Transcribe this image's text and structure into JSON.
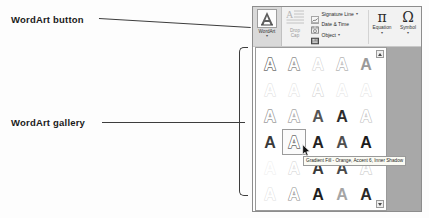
{
  "callouts": {
    "wordart_button_label": "WordArt button",
    "wordart_gallery_label": "WordArt gallery"
  },
  "ribbon": {
    "wordart": {
      "label": "WordArt",
      "caret": "▾",
      "icon": "wordart-a-icon"
    },
    "drop_cap": {
      "label_line1": "Drop",
      "label_line2": "Cap",
      "caret": "▾",
      "icon": "drop-cap-icon"
    },
    "commands": [
      {
        "label": "Signature Line",
        "icon": "signature-line-icon",
        "caret": "▾"
      },
      {
        "label": "Date & Time",
        "icon": "date-time-icon",
        "caret": ""
      },
      {
        "label": "Object",
        "icon": "object-icon",
        "caret": "▾"
      }
    ],
    "equation": {
      "glyph": "π",
      "label": "Equation",
      "caret": "▾"
    },
    "symbol": {
      "glyph": "Ω",
      "label": "Symbol",
      "caret": "▾"
    }
  },
  "gallery": {
    "scroll_up_icon": "scroll-up-arrow-icon",
    "scroll_down_icon": "scroll-down-arrow-icon",
    "selected_index": 16,
    "styles": [
      {
        "letter": "A",
        "name": "Fill - Black, Text 1, Shadow",
        "fill": "#6e6e6e",
        "stroke": "#4a4a4a",
        "outline": true,
        "strokew": 1.4
      },
      {
        "letter": "A",
        "name": "Fill - Blue, Accent 1, Shadow",
        "fill": "#8f8f8f",
        "stroke": "#5c5c5c",
        "outline": true,
        "strokew": 1.4
      },
      {
        "letter": "A",
        "name": "Fill - Orange, Accent 2, Outline - Accent 2",
        "fill": "#cfcfcf",
        "stroke": "#b6b6b6",
        "outline": true,
        "strokew": 1.0
      },
      {
        "letter": "A",
        "name": "Fill - White, Outline - Accent 1, Shadow",
        "fill": "#b5b5b5",
        "stroke": "#787878",
        "outline": true,
        "strokew": 1.3
      },
      {
        "letter": "A",
        "name": "Fill - Gray-50%, Accent 3, Sharp Bevel",
        "fill": "#9a9a9a",
        "stroke": "#6f6f6f",
        "outline": false,
        "strokew": 0
      },
      {
        "letter": "A",
        "name": "Gradient Fill - Gray",
        "fill": "#dcdcdc",
        "stroke": "#c4c4c4",
        "outline": true,
        "strokew": 0.9
      },
      {
        "letter": "A",
        "name": "Gradient Fill - Blue, Accent 1, Reflection",
        "fill": "#e0e0e0",
        "stroke": "#c2c2c2",
        "outline": true,
        "strokew": 0.9
      },
      {
        "letter": "A",
        "name": "Gradient Fill - Orange, Accent 2, Reflection",
        "fill": "#cdcdcd",
        "stroke": "#a9a9a9",
        "outline": true,
        "strokew": 0.9
      },
      {
        "letter": "A",
        "name": "Fill - White, Outline - Accent 2, Hard Shadow",
        "fill": "#e3e3e3",
        "stroke": "#cacaca",
        "outline": true,
        "strokew": 0.9
      },
      {
        "letter": "A",
        "name": "Fill - Gray-25%, Background 2, Inner Shadow",
        "fill": "#e2e2e2",
        "stroke": "#c8c8c8",
        "outline": true,
        "strokew": 0.9
      },
      {
        "letter": "A",
        "name": "Fill - Black, Text 1, Outline - Background 1",
        "fill": "#9d9d9d",
        "stroke": "#5f5f5f",
        "outline": true,
        "strokew": 1.5
      },
      {
        "letter": "A",
        "name": "Fill - Blue, Accent 1, Outline - Background 1",
        "fill": "#a9a9a9",
        "stroke": "#6a6a6a",
        "outline": true,
        "strokew": 1.5
      },
      {
        "letter": "A",
        "name": "Fill - Gray-50%, Accent 3, Hard Shadow",
        "fill": "#555555",
        "stroke": "#3a3a3a",
        "outline": false,
        "strokew": 0
      },
      {
        "letter": "A",
        "name": "Fill - Black, Text 1, Hard Shadow, Accent 1",
        "fill": "#2d2d2d",
        "stroke": "#1f1f1f",
        "outline": false,
        "strokew": 0
      },
      {
        "letter": "A",
        "name": "Fill - Orange, Accent 2, Matte Bevel",
        "fill": "#c0c0c0",
        "stroke": "#9d9d9d",
        "outline": true,
        "strokew": 1.2
      },
      {
        "letter": "A",
        "name": "Fill - Black, Text 1, Shadow",
        "fill": "#3a3a3a",
        "stroke": "#262626",
        "outline": false,
        "strokew": 0
      },
      {
        "letter": "A",
        "name": "Gradient Fill - Orange, Accent 6, Inner Shadow",
        "fill": "#6a6a6a",
        "stroke": "#4d4d4d",
        "outline": true,
        "strokew": 1.3
      },
      {
        "letter": "A",
        "name": "Fill - Gray-50%, Accent 3, Sharp Bevel",
        "fill": "#232323",
        "stroke": "#141414",
        "outline": false,
        "strokew": 0
      },
      {
        "letter": "A",
        "name": "Fill - Blue, Accent 1, Outline - Background 1, Hard Shadow",
        "fill": "#4f4f4f",
        "stroke": "#333333",
        "outline": false,
        "strokew": 0
      },
      {
        "letter": "A",
        "name": "Fill - Black, Text 1, Outline - Background 1, Hard Shadow",
        "fill": "#1b1b1b",
        "stroke": "#0d0d0d",
        "outline": false,
        "strokew": 0
      },
      {
        "letter": "A",
        "name": "Gradient Fill - Gray, Outline - Gray",
        "fill": "#ededed",
        "stroke": "#d8d8d8",
        "outline": true,
        "strokew": 0.9
      },
      {
        "letter": "A",
        "name": "Gradient Fill - Blue, Accent 1, Outline",
        "fill": "#d2d2d2",
        "stroke": "#aeaeae",
        "outline": true,
        "strokew": 0.9
      },
      {
        "letter": "A",
        "name": "Fill - Gray-50%, Accent 3, Powder Bevel",
        "fill": "#3a3a3a",
        "stroke": "#252525",
        "outline": false,
        "strokew": 0
      },
      {
        "letter": "A",
        "name": "Fill - Orange, Accent 2, Outline - Accent 2",
        "fill": "#4a4a4a",
        "stroke": "#303030",
        "outline": false,
        "strokew": 0
      },
      {
        "letter": "A",
        "name": "Fill - White, Outline - Accent 1, Glow - Accent 1",
        "fill": "#d5d5d5",
        "stroke": "#a0a0a0",
        "outline": true,
        "strokew": 1.4
      },
      {
        "letter": "A",
        "name": "Fill - White, Outline - Accent 2, Hard Shadow - Accent 2",
        "fill": "#e0e0e0",
        "stroke": "#c0c0c0",
        "outline": true,
        "strokew": 1.0
      },
      {
        "letter": "A",
        "name": "Gradient Fill - Gray, Outline - Gray, Reflection",
        "fill": "#8f8f8f",
        "stroke": "#636363",
        "outline": true,
        "strokew": 1.2
      },
      {
        "letter": "A",
        "name": "Fill - Black, Text 1, Shadow, Bevel",
        "fill": "#1e1e1e",
        "stroke": "#101010",
        "outline": false,
        "strokew": 0
      },
      {
        "letter": "A",
        "name": "Fill - Gray-50%, Accent 3, Reflection",
        "fill": "#a5a5a5",
        "stroke": "#7a7a7a",
        "outline": false,
        "strokew": 0
      },
      {
        "letter": "A",
        "name": "Fill - Black, Text 1, Inner Shadow",
        "fill": "#2a2a2a",
        "stroke": "#1a1a1a",
        "outline": false,
        "strokew": 0
      }
    ]
  },
  "tooltip": {
    "text": "Gradient Fill - Orange, Accent 6, Inner Shadow"
  },
  "cursor": {
    "icon": "mouse-pointer-icon"
  },
  "colors": {
    "ribbon_bg": "#f2f2f2",
    "button_pressed_bg": "#d9d9d9",
    "panel_border": "#9a9a9a",
    "document_bg": "#a8a8a8",
    "leader_line": "#3d3d3d",
    "tooltip_bg": "#fbfbf4"
  }
}
